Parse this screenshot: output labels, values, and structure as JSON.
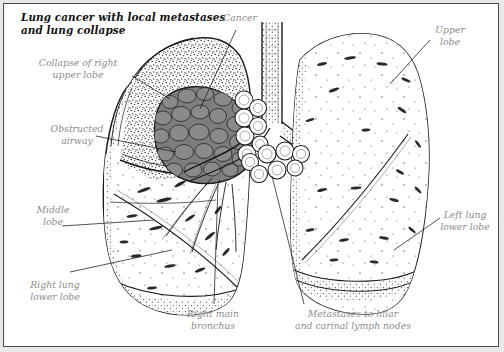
{
  "figure": {
    "title": "Lung cancer with local metastases\nand lung collapse",
    "frame_color": "#4a4a4a",
    "background_color": "#ffffff",
    "outer_background_color": "#e9e9e9",
    "label_color": "#8b8b8b",
    "ink_color": "#1a1a1a",
    "tumor_color": "#7d7d7d",
    "stipple_color": "#2b2b2b"
  },
  "labels": [
    {
      "id": "collapse-of-right-upper-lobe",
      "text": "Collapse of right\nupper lobe",
      "align": "ctr"
    },
    {
      "id": "cancer",
      "text": "Cancer",
      "align": "ctr"
    },
    {
      "id": "upper-lobe",
      "text": "Upper\nlobe",
      "align": "ctr"
    },
    {
      "id": "obstructed-airway",
      "text": "Obstructed\nairway",
      "align": "ctr"
    },
    {
      "id": "middle-lobe",
      "text": "Middle\nlobe",
      "align": "ctr"
    },
    {
      "id": "left-lung-lower-lobe",
      "text": "Left lung\nlower lobe",
      "align": "ctr"
    },
    {
      "id": "right-lung-lower-lobe",
      "text": "Right lung\nlower lobe",
      "align": "ctr"
    },
    {
      "id": "right-main-bronchus",
      "text": "Right main\nbronchus",
      "align": "ctr"
    },
    {
      "id": "metastases-to-hilar-and-carinal-lymph-nodes",
      "text": "Metastases to hilar\nand carinal lymph nodes",
      "align": "ctr"
    }
  ],
  "anatomy": {
    "structures": [
      "right-lung-outline",
      "left-lung-outline",
      "trachea",
      "right-main-bronchus",
      "left-main-bronchus",
      "bronchial-tree",
      "collapsed-right-upper-lobe",
      "tumor-mass",
      "hilar-lymph-nodes",
      "carinal-lymph-nodes",
      "oblique-fissure",
      "horizontal-fissure",
      "diaphragm-band"
    ]
  }
}
